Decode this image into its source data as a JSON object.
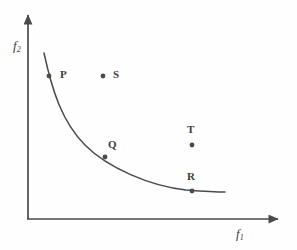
{
  "figure": {
    "title": "",
    "background_color": "#fefefe",
    "ink_color": "#4a4a4a",
    "width": 297,
    "height": 250
  },
  "axes": {
    "x_label": "f",
    "x_label_sub": "1",
    "y_label": "f",
    "y_label_sub": "2",
    "origin": {
      "x": 28,
      "y": 219
    },
    "x_axis_end": {
      "x": 282,
      "y": 219
    },
    "y_axis_end": {
      "x": 28,
      "y": 12
    },
    "arrowheads": true,
    "ticks": false,
    "grid": false
  },
  "chart_data": {
    "type": "scatter",
    "title": "",
    "xlabel": "f1",
    "ylabel": "f2",
    "xlim": [
      0,
      100
    ],
    "ylim": [
      0,
      100
    ],
    "grid": false,
    "legend": null,
    "curve": {
      "name": "Pareto front",
      "style": "solid",
      "color": "#4a4a4a",
      "path": "M 44 53 C 52 90, 62 122, 85 145 C 108 168, 150 186, 186 190 C 200 191, 214 192, 225 192",
      "points_on_curve": [
        "P",
        "Q",
        "R"
      ]
    },
    "points": [
      {
        "label": "P",
        "x": 49,
        "y": 76,
        "on_curve": true,
        "label_x": 60,
        "label_y": 68
      },
      {
        "label": "S",
        "x": 103,
        "y": 76,
        "on_curve": false,
        "label_x": 113,
        "label_y": 68
      },
      {
        "label": "Q",
        "x": 105,
        "y": 157,
        "on_curve": true,
        "label_x": 108,
        "label_y": 138
      },
      {
        "label": "T",
        "x": 192,
        "y": 145,
        "on_curve": false,
        "label_x": 187,
        "label_y": 123
      },
      {
        "label": "R",
        "x": 192,
        "y": 191,
        "on_curve": true,
        "label_x": 187,
        "label_y": 170
      }
    ],
    "marker": {
      "shape": "circle",
      "radius": 2.4,
      "color": "#4a4a4a"
    }
  }
}
